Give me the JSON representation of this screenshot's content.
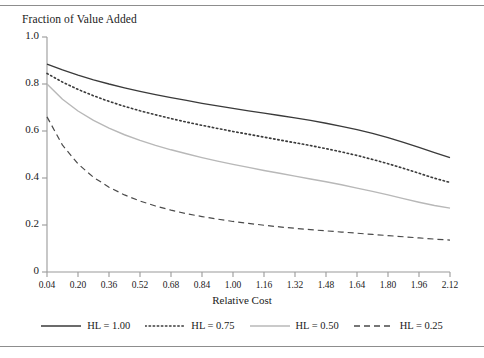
{
  "figure": {
    "title": "Fraction of Value Added",
    "xaxis_label": "Relative Cost"
  },
  "chart_data": {
    "type": "line",
    "title": "Fraction of Value Added",
    "xlabel": "Relative Cost",
    "ylabel": "Fraction of Value Added",
    "xlim": [
      0.04,
      2.12
    ],
    "ylim": [
      0,
      1.0
    ],
    "grid": false,
    "legend_position": "bottom",
    "xticks": [
      "0.04",
      "0.20",
      "0.36",
      "0.52",
      "0.68",
      "0.84",
      "1.00",
      "1.16",
      "1.32",
      "1.48",
      "1.64",
      "1.80",
      "1.96",
      "2.12"
    ],
    "xtick_values": [
      0.04,
      0.2,
      0.36,
      0.52,
      0.68,
      0.84,
      1.0,
      1.16,
      1.32,
      1.48,
      1.64,
      1.8,
      1.96,
      2.12
    ],
    "yticks": [
      "0",
      "0.2",
      "0.4",
      "0.6",
      "0.8",
      "1.0"
    ],
    "ytick_values": [
      0,
      0.2,
      0.4,
      0.6,
      0.8,
      1.0
    ],
    "x": [
      0.04,
      0.12,
      0.2,
      0.28,
      0.36,
      0.44,
      0.52,
      0.6,
      0.68,
      0.76,
      0.84,
      0.92,
      1.0,
      1.08,
      1.16,
      1.24,
      1.32,
      1.4,
      1.48,
      1.56,
      1.64,
      1.72,
      1.8,
      1.88,
      1.96,
      2.04,
      2.12
    ],
    "series": [
      {
        "name": "HL = 1.00",
        "style": "solid",
        "color": "#3a3a3a",
        "width": 1.3,
        "values": [
          0.885,
          0.86,
          0.838,
          0.818,
          0.8,
          0.784,
          0.769,
          0.755,
          0.742,
          0.73,
          0.718,
          0.707,
          0.696,
          0.686,
          0.676,
          0.666,
          0.656,
          0.645,
          0.633,
          0.62,
          0.606,
          0.59,
          0.572,
          0.552,
          0.53,
          0.508,
          0.487
        ]
      },
      {
        "name": "HL = 0.75",
        "style": "dotted",
        "color": "#3a3a3a",
        "width": 1.6,
        "values": [
          0.845,
          0.808,
          0.777,
          0.75,
          0.726,
          0.705,
          0.686,
          0.669,
          0.653,
          0.638,
          0.624,
          0.611,
          0.598,
          0.586,
          0.574,
          0.562,
          0.55,
          0.538,
          0.525,
          0.511,
          0.496,
          0.479,
          0.461,
          0.441,
          0.42,
          0.399,
          0.381
        ]
      },
      {
        "name": "HL = 0.50",
        "style": "solid",
        "color": "#b8b8b8",
        "width": 1.4,
        "values": [
          0.8,
          0.735,
          0.685,
          0.645,
          0.612,
          0.584,
          0.56,
          0.539,
          0.52,
          0.503,
          0.487,
          0.472,
          0.458,
          0.445,
          0.432,
          0.42,
          0.408,
          0.396,
          0.384,
          0.371,
          0.357,
          0.343,
          0.328,
          0.312,
          0.297,
          0.283,
          0.272
        ]
      },
      {
        "name": "HL = 0.25",
        "style": "dashed",
        "color": "#4a4a4a",
        "width": 1.2,
        "values": [
          0.66,
          0.54,
          0.46,
          0.403,
          0.361,
          0.328,
          0.302,
          0.281,
          0.263,
          0.248,
          0.236,
          0.225,
          0.215,
          0.207,
          0.199,
          0.192,
          0.186,
          0.18,
          0.175,
          0.17,
          0.165,
          0.16,
          0.155,
          0.15,
          0.145,
          0.14,
          0.136
        ]
      }
    ]
  },
  "legend": {
    "items": [
      {
        "label": "HL = 1.00",
        "style": "solid",
        "color": "#3a3a3a"
      },
      {
        "label": "HL = 0.75",
        "style": "dotted",
        "color": "#3a3a3a"
      },
      {
        "label": "HL = 0.50",
        "style": "solid",
        "color": "#b8b8b8"
      },
      {
        "label": "HL = 0.25",
        "style": "dashed",
        "color": "#4a4a4a"
      }
    ]
  },
  "axis_color": "#9a9a9a",
  "rule_color": "#8d8d8d"
}
